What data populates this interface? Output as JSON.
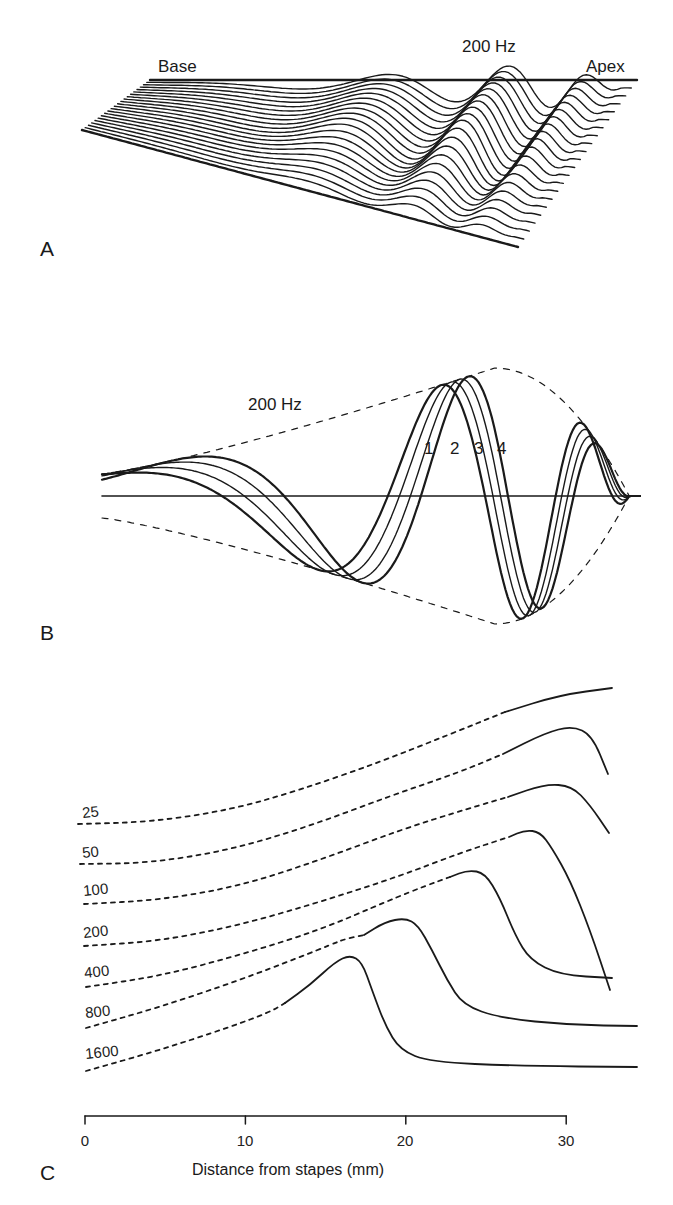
{
  "panels": {
    "a": {
      "letter": "A",
      "base_label": "Base",
      "freq_label": "200 Hz",
      "apex_label": "Apex"
    },
    "b": {
      "letter": "B",
      "freq_label": "200 Hz",
      "phase_labels": [
        "1",
        "2",
        "3",
        "4"
      ]
    },
    "c": {
      "letter": "C",
      "xlabel": "Distance from stapes (mm)",
      "ticks": [
        "0",
        "10",
        "20",
        "30"
      ],
      "curve_labels": [
        "25",
        "50",
        "100",
        "200",
        "400",
        "800",
        "1600"
      ]
    }
  },
  "chart_data": [
    {
      "panel": "A",
      "type": "line",
      "title": "Traveling wave snapshots along basilar membrane (3D perspective)",
      "annotations": [
        "Base",
        "200 Hz",
        "Apex"
      ],
      "n_traces": 22,
      "description": "Successive instantaneous displacement traces of a 200 Hz traveling wave, rendered in oblique perspective from base (left) to apex (right); peak occurs near apex region."
    },
    {
      "panel": "B",
      "type": "line",
      "title": "Traveling wave at 4 successive instants with envelope",
      "annotations": [
        "200 Hz"
      ],
      "series": [
        {
          "name": "1",
          "peak_x_rel": 0.735
        },
        {
          "name": "2",
          "peak_x_rel": 0.77
        },
        {
          "name": "3",
          "peak_x_rel": 0.8
        },
        {
          "name": "4",
          "peak_x_rel": 0.83
        }
      ],
      "envelope": "dashed, max near x_rel 0.73",
      "grid": false
    },
    {
      "panel": "C",
      "type": "line",
      "title": "Envelopes of traveling waves for different frequencies",
      "xlabel": "Distance from stapes (mm)",
      "ylabel": "",
      "xlim": [
        0,
        34
      ],
      "xticks": [
        0,
        10,
        20,
        30
      ],
      "series": [
        {
          "name": "25",
          "peak_x_mm": 34,
          "solid_from_mm": 26.5
        },
        {
          "name": "50",
          "peak_x_mm": 30.5,
          "solid_from_mm": 26.5
        },
        {
          "name": "100",
          "peak_x_mm": 28,
          "solid_from_mm": 26.5
        },
        {
          "name": "200",
          "peak_x_mm": 28.5,
          "solid_from_mm": 27
        },
        {
          "name": "400",
          "peak_x_mm": 24,
          "solid_from_mm": 22.5
        },
        {
          "name": "800",
          "peak_x_mm": 20.2,
          "solid_from_mm": 17.5
        },
        {
          "name": "1600",
          "peak_x_mm": 17.5,
          "solid_from_mm": 12.5
        }
      ],
      "grid": false
    }
  ]
}
